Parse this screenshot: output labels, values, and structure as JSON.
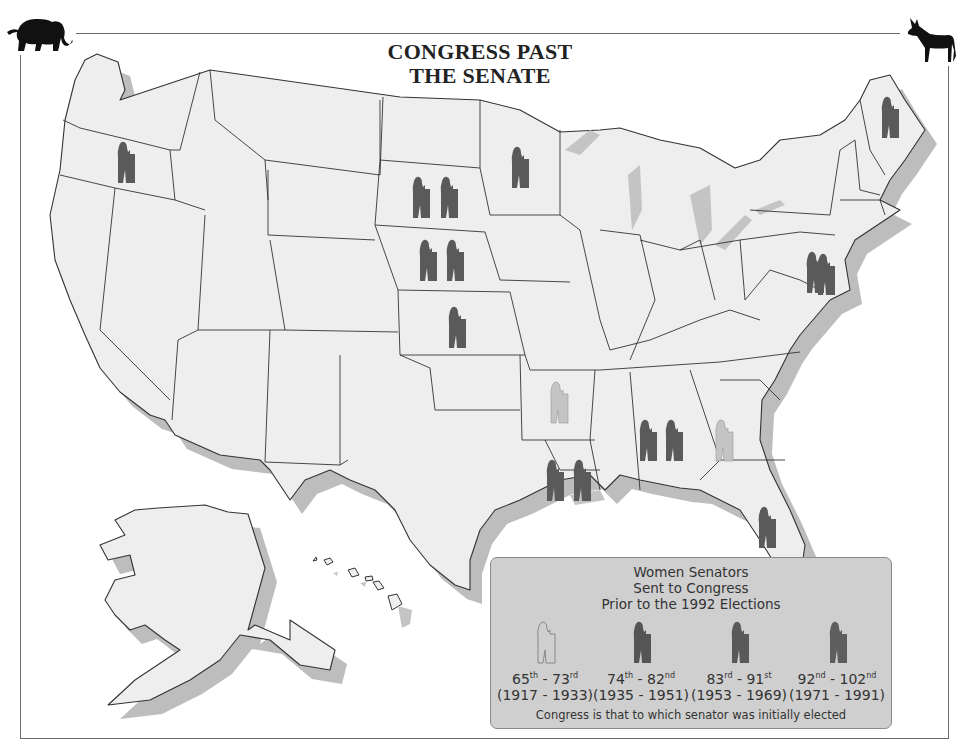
{
  "title": {
    "line1": "CONGRESS PAST",
    "line2": "THE SENATE"
  },
  "icons": {
    "left_mascot": "elephant-icon",
    "right_mascot": "donkey-icon",
    "senator": "senator-at-podium-icon"
  },
  "colors": {
    "land": "#eeeeee",
    "border": "#333333",
    "shadow": "#b9b9b9",
    "legend_bg": "#cfcfcf",
    "era_1": "#ffffff",
    "era_1_stroke": "#888888",
    "era_2": "#5a5a5a",
    "era_3": "#5e5e5e",
    "era_4": "#666666",
    "map_light": "#c4c4c4"
  },
  "legend": {
    "title_lines": [
      "Women Senators",
      "Sent to Congress",
      "Prior to the 1992 Elections"
    ],
    "items": [
      {
        "congress_start": "65",
        "start_suffix": "th",
        "congress_end": "73",
        "end_suffix": "rd",
        "years": "(1917 - 1933)",
        "style": "outline"
      },
      {
        "congress_start": "74",
        "start_suffix": "th",
        "congress_end": "82",
        "end_suffix": "nd",
        "years": "(1935 - 1951)",
        "style": "dark"
      },
      {
        "congress_start": "83",
        "start_suffix": "rd",
        "congress_end": "91",
        "end_suffix": "st",
        "years": "(1953 - 1969)",
        "style": "dark"
      },
      {
        "congress_start": "92",
        "start_suffix": "nd",
        "congress_end": "102",
        "end_suffix": "nd",
        "years": "(1971 - 1991)",
        "style": "dark"
      }
    ],
    "note": "Congress is that to which senator was initially elected"
  },
  "senators_by_state": [
    {
      "state": "Oregon",
      "count": 1,
      "shade": "dark"
    },
    {
      "state": "South Dakota",
      "count": 2,
      "shade": "dark"
    },
    {
      "state": "Nebraska",
      "count": 2,
      "shade": "dark"
    },
    {
      "state": "Kansas",
      "count": 1,
      "shade": "dark"
    },
    {
      "state": "Minnesota",
      "count": 1,
      "shade": "dark"
    },
    {
      "state": "Maine",
      "count": 1,
      "shade": "dark"
    },
    {
      "state": "Maryland",
      "count": 2,
      "shade": "dark"
    },
    {
      "state": "Arkansas",
      "count": 1,
      "shade": "light"
    },
    {
      "state": "Alabama",
      "count": 2,
      "shade": "dark"
    },
    {
      "state": "Georgia",
      "count": 1,
      "shade": "light"
    },
    {
      "state": "Louisiana",
      "count": 2,
      "shade": "dark"
    },
    {
      "state": "Florida",
      "count": 1,
      "shade": "dark"
    }
  ]
}
